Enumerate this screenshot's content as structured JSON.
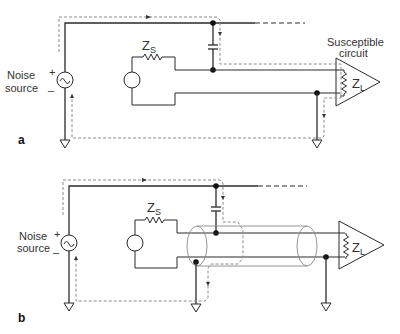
{
  "figure": {
    "panels": [
      {
        "id": "a",
        "label": "a",
        "noise_source": {
          "line1": "Noise",
          "line2": "source",
          "plus": "+",
          "minus": "–"
        },
        "source_impedance": {
          "symbol": "Z",
          "subscript": "S"
        },
        "load_impedance": {
          "symbol": "Z",
          "subscript": "L"
        },
        "receiver_caption": {
          "line1": "Susceptible",
          "line2": "circuit"
        },
        "shielded": false
      },
      {
        "id": "b",
        "label": "b",
        "noise_source": {
          "line1": "Noise",
          "line2": "source",
          "plus": "+",
          "minus": "–"
        },
        "source_impedance": {
          "symbol": "Z",
          "subscript": "S"
        },
        "load_impedance": {
          "symbol": "Z",
          "subscript": "L"
        },
        "shielded": true
      }
    ],
    "colors": {
      "wire": "#2a2a2a",
      "noise_path": "#8c8c8c",
      "shield": "#8a8a8a"
    }
  }
}
